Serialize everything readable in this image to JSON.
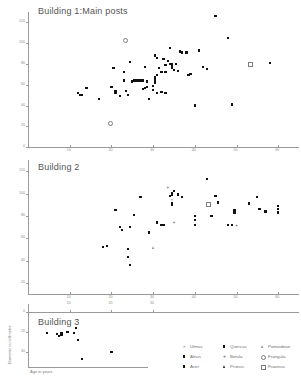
{
  "chart_data": {
    "type": "scatter",
    "title": "",
    "xlabel": "Age in years",
    "ylabel": "Diameter in millimetre",
    "panels": [
      {
        "label": "Building 1:Main posts",
        "xlim": [
          0,
          65
        ],
        "ylim": [
          0,
          130
        ],
        "xticks": [
          10,
          20,
          30,
          40,
          50,
          60
        ],
        "yticks": [
          0,
          20,
          40,
          60,
          80,
          100,
          120
        ],
        "grid": false,
        "series": [
          {
            "name": "Quercus",
            "marker": "filled-square",
            "points": [
              [
                12,
                52
              ],
              [
                12.5,
                50
              ],
              [
                13,
                50
              ],
              [
                14,
                57
              ],
              [
                17,
                46
              ],
              [
                20,
                58
              ],
              [
                20.5,
                76
              ],
              [
                21,
                52
              ],
              [
                21,
                54
              ],
              [
                22,
                49
              ],
              [
                23,
                64
              ],
              [
                23,
                72
              ],
              [
                23.5,
                54
              ],
              [
                24,
                50
              ],
              [
                24.5,
                82
              ],
              [
                25,
                63
              ],
              [
                25.5,
                64
              ],
              [
                26,
                64
              ],
              [
                26.5,
                64
              ],
              [
                27,
                64
              ],
              [
                27.5,
                64
              ],
              [
                27.5,
                56
              ],
              [
                28,
                57
              ],
              [
                28,
                77
              ],
              [
                28.5,
                63
              ],
              [
                28.5,
                58
              ],
              [
                29,
                46
              ],
              [
                30,
                55
              ],
              [
                30,
                59
              ],
              [
                30.5,
                62
              ],
              [
                30.5,
                64
              ],
              [
                30.5,
                66
              ],
              [
                30.5,
                67
              ],
              [
                30.5,
                88
              ],
              [
                31,
                86
              ],
              [
                31,
                69
              ],
              [
                31,
                52
              ],
              [
                31.5,
                76
              ],
              [
                32,
                53
              ],
              [
                32,
                72
              ],
              [
                32.5,
                85
              ],
              [
                33,
                79
              ],
              [
                33,
                72
              ],
              [
                33,
                52
              ],
              [
                33.5,
                83
              ],
              [
                34,
                95
              ],
              [
                34,
                80
              ],
              [
                34.5,
                80
              ],
              [
                34.5,
                79
              ],
              [
                34.5,
                78
              ],
              [
                34.5,
                77
              ],
              [
                34.5,
                76
              ],
              [
                35,
                74
              ],
              [
                35.5,
                80
              ],
              [
                36,
                73
              ],
              [
                36.5,
                92
              ],
              [
                37,
                91
              ],
              [
                38,
                91
              ],
              [
                38.5,
                69
              ],
              [
                39,
                70
              ],
              [
                40,
                40
              ],
              [
                41,
                93
              ],
              [
                42,
                77
              ],
              [
                43,
                75
              ],
              [
                45,
                126
              ],
              [
                48,
                105
              ],
              [
                49,
                41
              ],
              [
                58,
                81
              ]
            ]
          },
          {
            "name": "Frangula",
            "marker": "open-circle",
            "points": [
              [
                19.5,
                24
              ],
              [
                23,
                104
              ]
            ]
          },
          {
            "name": "Fraxinus",
            "marker": "open-square",
            "points": [
              [
                53,
                81
              ]
            ]
          }
        ]
      },
      {
        "label": "Building 2",
        "xlim": [
          0,
          65
        ],
        "ylim": [
          10,
          130
        ],
        "xticks": [
          10,
          20,
          30,
          40,
          50,
          60
        ],
        "yticks": [
          20,
          40,
          60,
          80,
          100,
          120
        ],
        "grid": false,
        "series": [
          {
            "name": "Quercus",
            "marker": "filled-square",
            "points": [
              [
                18,
                52
              ],
              [
                19,
                53
              ],
              [
                21,
                85
              ],
              [
                22,
                70
              ],
              [
                22.5,
                67
              ],
              [
                24,
                50
              ],
              [
                24,
                43
              ],
              [
                24.5,
                36
              ],
              [
                24.5,
                70
              ],
              [
                25.5,
                81
              ],
              [
                27,
                97
              ],
              [
                29,
                65
              ],
              [
                31,
                74
              ],
              [
                32,
                72
              ],
              [
                32.5,
                72
              ],
              [
                34,
                98
              ],
              [
                34.5,
                100
              ],
              [
                34.5,
                99
              ],
              [
                34.5,
                91
              ],
              [
                34.5,
                90
              ],
              [
                35,
                102
              ],
              [
                36,
                99
              ],
              [
                37,
                97
              ],
              [
                40,
                80
              ],
              [
                40,
                76
              ],
              [
                40,
                72
              ],
              [
                43,
                113
              ],
              [
                44,
                80
              ],
              [
                45,
                98
              ],
              [
                45.5,
                92
              ],
              [
                48,
                72
              ],
              [
                49,
                72
              ],
              [
                49.5,
                85
              ],
              [
                49.5,
                84
              ],
              [
                49.5,
                83
              ],
              [
                53,
                91
              ],
              [
                55,
                97
              ],
              [
                55.5,
                86
              ],
              [
                57,
                84
              ],
              [
                60,
                89
              ],
              [
                60,
                86
              ],
              [
                60,
                83
              ]
            ]
          },
          {
            "name": "Fraxinus",
            "marker": "open-square",
            "points": [
              [
                43,
                91
              ]
            ]
          },
          {
            "name": "Pomoideae",
            "marker": "open-triangle",
            "points": [
              [
                30,
                52
              ]
            ]
          },
          {
            "name": "Betula",
            "marker": "plus",
            "points": [
              [
                33.5,
                106
              ],
              [
                35,
                74
              ],
              [
                50,
                72
              ]
            ]
          },
          {
            "name": "Ulmus",
            "marker": "x",
            "points": [
              [
                34.5,
                95
              ]
            ]
          }
        ]
      },
      {
        "label": "Building 3",
        "xlim": [
          0,
          65
        ],
        "ylim": [
          0,
          55
        ],
        "xticks": [
          10,
          20,
          30
        ],
        "yticks": [
          0,
          20,
          40
        ],
        "grid": false,
        "series": [
          {
            "name": "Quercus",
            "marker": "filled-square",
            "points": [
              [
                4.5,
                21
              ],
              [
                7,
                22
              ],
              [
                7.5,
                24
              ],
              [
                8,
                23
              ],
              [
                8,
                21
              ],
              [
                9.5,
                20
              ],
              [
                11,
                21
              ],
              [
                11.5,
                16
              ],
              [
                12,
                28
              ],
              [
                13,
                47
              ],
              [
                20,
                40
              ]
            ]
          }
        ]
      }
    ],
    "legend": {
      "position": "bottom-right",
      "entries": [
        {
          "label": "Ulmus",
          "marker": "x"
        },
        {
          "label": "Alnus",
          "marker": "filled-square"
        },
        {
          "label": "Acer",
          "marker": "filled-square"
        },
        {
          "label": "Quercus",
          "marker": "filled-square"
        },
        {
          "label": "Betula",
          "marker": "plus"
        },
        {
          "label": "Prunus",
          "marker": "filled-triangle"
        },
        {
          "label": "Pomoideae",
          "marker": "open-triangle"
        },
        {
          "label": "Frangula",
          "marker": "open-circle"
        },
        {
          "label": "Fraxinus",
          "marker": "open-square"
        }
      ]
    },
    "colors": {
      "marker": "#111111",
      "axis": "#9a9a9a",
      "text": "#6f6f6f",
      "background": "#ffffff"
    }
  }
}
